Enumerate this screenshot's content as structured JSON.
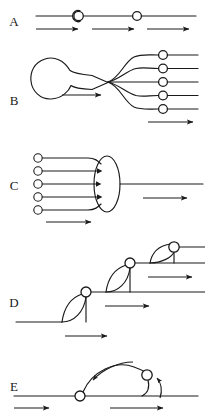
{
  "figure": {
    "title": "",
    "background_color": "#ffffff",
    "stroke_color": "#1a1a1a",
    "width": 205,
    "height": 415
  },
  "panels": [
    {
      "id": "A",
      "label": "A",
      "label_x": 14,
      "label_y": 26,
      "description": "single horizontal line carrying two circular nodes, three rightward flow arrows beneath",
      "node_count": 2,
      "line_y": 16,
      "line_x1": 36,
      "line_x2": 196,
      "nodes": [
        {
          "cx": 78,
          "cy": 16,
          "r": 5.6
        },
        {
          "cx": 137,
          "cy": 16,
          "r": 4.6
        }
      ],
      "arrows": [
        {
          "x1": 36,
          "y1": 29,
          "x2": 81,
          "y2": 29
        },
        {
          "x1": 92,
          "y1": 29,
          "x2": 137,
          "y2": 29
        },
        {
          "x1": 147,
          "y1": 29,
          "x2": 192,
          "y2": 29
        }
      ]
    },
    {
      "id": "B",
      "label": "B",
      "label_x": 14,
      "label_y": 105,
      "description": "teardrop reservoir tapering to a stem which fans out into five branch lines, each bearing a circular node",
      "branch_count": 5,
      "bulb": {
        "cx": 54,
        "cy": 80,
        "r": 18
      },
      "converge_x": 108,
      "converge_y": 82,
      "branch_rows": [
        55,
        69,
        82,
        95,
        108
      ],
      "node_x": 163,
      "node_r": 4.4,
      "branch_end_x": 198,
      "arrows": [
        {
          "x1": 62,
          "y1": 95,
          "x2": 104,
          "y2": 95
        },
        {
          "x1": 148,
          "y1": 122,
          "x2": 196,
          "y2": 122
        }
      ]
    },
    {
      "id": "C",
      "label": "C",
      "label_x": 14,
      "label_y": 190,
      "description": "five input lines each starting at a circular node converge into a vertical ellipse, a single output line leaves to the right",
      "input_count": 5,
      "node_x": 38,
      "node_r": 4.2,
      "input_rows": [
        158,
        171,
        184,
        197,
        210
      ],
      "ellipse": {
        "cx": 107,
        "cy": 184,
        "rx": 13,
        "ry": 28
      },
      "output_y": 184,
      "output_x2": 203,
      "arrows": [
        {
          "x1": 46,
          "y1": 222,
          "x2": 94,
          "y2": 222
        },
        {
          "x1": 143,
          "y1": 198,
          "x2": 190,
          "y2": 198
        }
      ]
    },
    {
      "id": "D",
      "label": "D",
      "label_x": 14,
      "label_y": 307,
      "description": "cascading staircase of three horizontal levels linked by lens shaped loops, a circular node sits at each upper junction",
      "step_count": 3,
      "levels": [
        322,
        292,
        263,
        247
      ],
      "nodes": [
        {
          "cx": 86,
          "cy": 292,
          "r": 5.0
        },
        {
          "cx": 130,
          "cy": 263,
          "r": 5.0
        },
        {
          "cx": 174,
          "cy": 247,
          "r": 5.2
        }
      ],
      "arrows": [
        {
          "x1": 65,
          "y1": 336,
          "x2": 110,
          "y2": 336
        },
        {
          "x1": 105,
          "y1": 306,
          "x2": 152,
          "y2": 306
        },
        {
          "x1": 148,
          "y1": 277,
          "x2": 195,
          "y2": 277
        }
      ]
    },
    {
      "id": "E",
      "label": "E",
      "label_x": 14,
      "label_y": 391,
      "description": "horizontal line with two circular nodes joined by an arc, curved arrows indicate leftward transport along the arc and upward return at the right node",
      "line_y": 396,
      "line_x1": 14,
      "line_x2": 198,
      "nodes": [
        {
          "cx": 80,
          "cy": 396,
          "r": 5.0
        },
        {
          "cx": 147,
          "cy": 375,
          "r": 5.2
        }
      ],
      "arrows": [
        {
          "x1": 14,
          "y1": 408,
          "x2": 52,
          "y2": 408
        },
        {
          "x1": 110,
          "y1": 408,
          "x2": 166,
          "y2": 408
        }
      ],
      "curved_arrows": [
        {
          "direction": "left",
          "label": "arc-transport-left"
        },
        {
          "direction": "up",
          "label": "node-return-up"
        }
      ]
    }
  ]
}
